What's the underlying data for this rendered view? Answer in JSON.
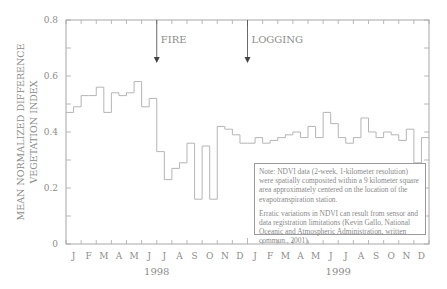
{
  "chart_data": {
    "type": "line",
    "style": "step",
    "title": "",
    "xlabel": "",
    "ylabel": "MEAN NORMALIZED DIFFERENCE VEGETATION INDEX",
    "ylabel_lines": [
      "MEAN NORMALIZED DIFFERENCE",
      "VEGETATION INDEX"
    ],
    "ylim": [
      0,
      0.8
    ],
    "yticks": [
      0,
      0.2,
      0.4,
      0.6,
      0.8
    ],
    "ytick_labels": [
      "0",
      "0.2",
      "0.4",
      "0.6",
      "0.8"
    ],
    "month_labels": [
      "J",
      "F",
      "M",
      "A",
      "M",
      "J",
      "J",
      "A",
      "S",
      "O",
      "N",
      "D",
      "J",
      "F",
      "M",
      "A",
      "M",
      "J",
      "J",
      "A",
      "S",
      "O",
      "N",
      "D"
    ],
    "year_labels": [
      {
        "label": "1998",
        "month_index": 6
      },
      {
        "label": "1999",
        "month_index": 18
      }
    ],
    "grid": false,
    "series": [
      {
        "name": "Mean NDVI (2-week composites)",
        "x_period": "semi-monthly, Jan 1998 - Dec 1999",
        "values": [
          0.47,
          0.49,
          0.53,
          0.53,
          0.56,
          0.47,
          0.54,
          0.53,
          0.54,
          0.58,
          0.49,
          0.52,
          0.33,
          0.23,
          0.27,
          0.29,
          0.36,
          0.16,
          0.35,
          0.16,
          0.42,
          0.41,
          0.39,
          0.36,
          0.36,
          0.38,
          0.36,
          0.37,
          0.38,
          0.39,
          0.4,
          0.38,
          0.42,
          0.38,
          0.47,
          0.43,
          0.38,
          0.36,
          0.38,
          0.45,
          0.4,
          0.38,
          0.4,
          0.39,
          0.37,
          0.41,
          0.29,
          0.38
        ]
      }
    ],
    "annotations": [
      {
        "label": "FIRE",
        "month_index": 6.0,
        "type": "arrow-down"
      },
      {
        "label": "LOGGING",
        "month_index": 12.0,
        "type": "arrow-down"
      }
    ],
    "notes": [
      "Note: NDVI data (2-week, 1-kilometer resolution) were spatially composited within a 9 kilometer square area approximately centered on the location of the evapotranspiration station.",
      "Erratic variations in NDVI can result from sensor and data registration limitations (Kevin Gallo, National Oceanic and Atmospheric Administration, written commun., 2001)."
    ],
    "colors": {
      "line": "#b5b5b5",
      "axis": "#a8a8a8",
      "text": "#8c8c8c"
    }
  }
}
